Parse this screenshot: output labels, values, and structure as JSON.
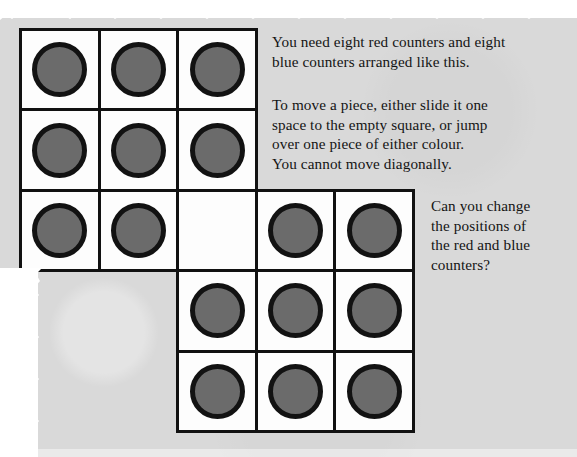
{
  "page": {
    "background_color": "#d9d9d9",
    "paper_edge_color": "#ffffff",
    "ink_color": "#141414"
  },
  "instructions": {
    "paragraph_1_line_1": "You need eight red counters and eight",
    "paragraph_1_line_2": "blue counters arranged like this.",
    "paragraph_2_line_1": "To move a piece, either slide it one",
    "paragraph_2_line_2": "space to the empty square, or jump",
    "paragraph_2_line_3": "over one piece of either colour.",
    "paragraph_2_line_4": "You cannot move diagonally.",
    "paragraph_3_line_1": "Can you change",
    "paragraph_3_line_2": "the positions of",
    "paragraph_3_line_3": "the red and blue",
    "paragraph_3_line_4": "counters?"
  },
  "board": {
    "counter_fill_color": "#6b6b6b",
    "counter_border_color": "#121212",
    "cell_fill_color": "#fdfdfd",
    "cell_border_color": "#111111",
    "counter_count": 16,
    "empty_cell_count": 1,
    "origin_x": 19,
    "origin_y": 28,
    "cell_width": 78.6,
    "cell_height": 80.4,
    "cells": [
      {
        "row": 0,
        "col": 0,
        "state": "counter"
      },
      {
        "row": 0,
        "col": 1,
        "state": "counter"
      },
      {
        "row": 0,
        "col": 2,
        "state": "counter"
      },
      {
        "row": 1,
        "col": 0,
        "state": "counter"
      },
      {
        "row": 1,
        "col": 1,
        "state": "counter"
      },
      {
        "row": 1,
        "col": 2,
        "state": "counter"
      },
      {
        "row": 2,
        "col": 0,
        "state": "counter"
      },
      {
        "row": 2,
        "col": 1,
        "state": "counter"
      },
      {
        "row": 2,
        "col": 2,
        "state": "empty"
      },
      {
        "row": 2,
        "col": 3,
        "state": "counter"
      },
      {
        "row": 2,
        "col": 4,
        "state": "counter"
      },
      {
        "row": 3,
        "col": 2,
        "state": "counter"
      },
      {
        "row": 3,
        "col": 3,
        "state": "counter"
      },
      {
        "row": 3,
        "col": 4,
        "state": "counter"
      },
      {
        "row": 4,
        "col": 2,
        "state": "counter"
      },
      {
        "row": 4,
        "col": 3,
        "state": "counter"
      },
      {
        "row": 4,
        "col": 4,
        "state": "counter"
      }
    ]
  }
}
